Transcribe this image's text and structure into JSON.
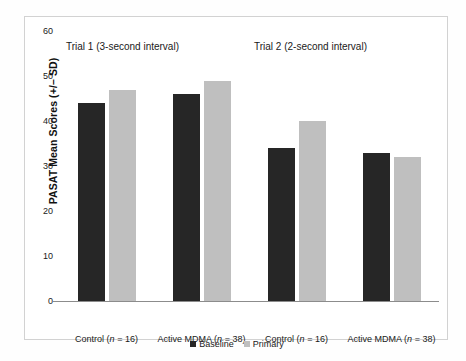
{
  "chart_data": {
    "type": "bar",
    "title": "",
    "xlabel": "",
    "ylabel": "PASAT Mean Scores (+/– SD)",
    "ylim": [
      0,
      60
    ],
    "yticks": [
      "0",
      "10",
      "20",
      "30",
      "40",
      "50",
      "60"
    ],
    "ytick_values": [
      0,
      10,
      20,
      30,
      40,
      50,
      60
    ],
    "grid": false,
    "legend_position": "bottom-center",
    "panel_titles": [
      "Trial 1 (3-second interval)",
      "Trial 2 (2-second interval)"
    ],
    "categories": [
      "Control (n = 16)",
      "Active MDMA (n = 38)",
      "Control (n = 16)",
      "Active MDMA (n = 38)"
    ],
    "category_parts": [
      {
        "name": "Control",
        "n_prefix": " (",
        "n_italic": "n",
        "n_suffix": " = 16)"
      },
      {
        "name": "Active MDMA",
        "n_prefix": " (",
        "n_italic": "n",
        "n_suffix": " = 38)"
      },
      {
        "name": "Control",
        "n_prefix": " (",
        "n_italic": "n",
        "n_suffix": " = 16)"
      },
      {
        "name": "Active MDMA",
        "n_prefix": " (",
        "n_italic": "n",
        "n_suffix": " = 38)"
      }
    ],
    "series": [
      {
        "name": "Baseline",
        "color": "#262626",
        "values": [
          44,
          46,
          34,
          33
        ]
      },
      {
        "name": "Primary",
        "color": "#bfbfbf",
        "values": [
          47,
          49,
          40,
          32
        ]
      }
    ]
  },
  "legend": {
    "items": [
      {
        "label": "Baseline",
        "color": "#262626"
      },
      {
        "label": "Primary",
        "color": "#bfbfbf"
      }
    ]
  }
}
